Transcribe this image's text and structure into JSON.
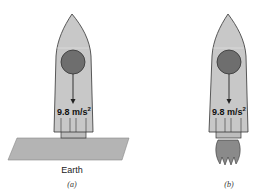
{
  "figure": {
    "panels": [
      {
        "id": "a",
        "caption": "(a)",
        "acceleration_label": "9.8 m/s",
        "acceleration_exponent": "2",
        "ground_label": "Earth",
        "state": "rocket resting on Earth's surface"
      },
      {
        "id": "b",
        "caption": "(b)",
        "acceleration_label": "9.8 m/s",
        "acceleration_exponent": "2",
        "state": "rocket firing engine in space"
      }
    ],
    "colors": {
      "rocket_body": "#c8c8c8",
      "rocket_outline": "#333333",
      "ball": "#6e6e6e",
      "ground": "#b4b4b4",
      "flame": "#8a8a8a"
    }
  }
}
